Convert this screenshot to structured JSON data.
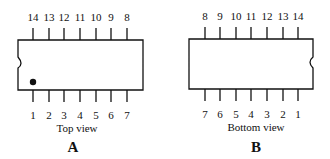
{
  "diagram": {
    "views": [
      {
        "id": "A",
        "letter": "A",
        "caption": "Top view",
        "top_pins": [
          "14",
          "13",
          "12",
          "11",
          "10",
          "9",
          "8"
        ],
        "bottom_pins": [
          "1",
          "2",
          "3",
          "4",
          "5",
          "6",
          "7"
        ],
        "notch_side": "left",
        "pin1_dot": true
      },
      {
        "id": "B",
        "letter": "B",
        "caption": "Bottom view",
        "top_pins": [
          "8",
          "9",
          "10",
          "11",
          "12",
          "13",
          "14"
        ],
        "bottom_pins": [
          "7",
          "6",
          "5",
          "4",
          "3",
          "2",
          "1"
        ],
        "notch_side": "right",
        "pin1_dot": false
      }
    ]
  }
}
